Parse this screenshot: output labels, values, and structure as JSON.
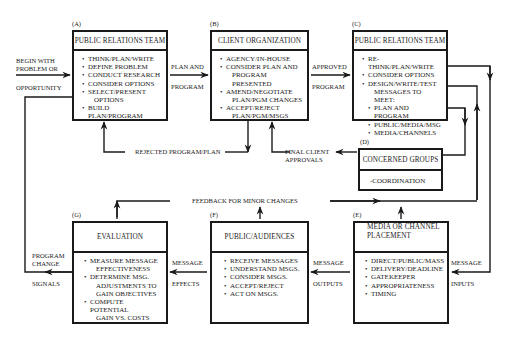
{
  "diagram": {
    "entry": {
      "line1": "BEGIN WITH",
      "line2": "PROBLEM OR",
      "line3": "OPPORTUNITY"
    },
    "boxes": {
      "A": {
        "tag": "(A)",
        "title": "PUBLIC RELATIONS TEAM",
        "items": [
          "THINK/PLAN/WRITE",
          "DEFINE PROBLEM",
          "CONDUCT RESEARCH",
          "CONSIDER OPTIONS",
          "SELECT/PRESENT",
          "BUILD PLAN/PROGRAM"
        ],
        "item_cont": {
          "4": "OPTIONS"
        }
      },
      "B": {
        "tag": "(B)",
        "title": "CLIENT ORGANIZATION",
        "items": [
          "AGENCY/IN-HOUSE",
          "CONSIDER PLAN AND",
          "AMEND/NEGOTIATE",
          "ACCEPT/REJECT"
        ],
        "item_cont": {
          "1": "PROGRAM PRESENTED",
          "2": "PLAN/PGM CHANGES",
          "3": "PLAN/PGM/MSGS"
        }
      },
      "C": {
        "tag": "(C)",
        "title": "PUBLIC RELATIONS TEAM",
        "items": [
          "RE-THINK/PLAN/WRITE",
          "CONSIDER OPTIONS",
          "DESIGN/WRITE/TEST"
        ],
        "item_cont": {
          "2": "MESSAGES TO MEET:"
        },
        "subitems": [
          "PLAN AND PROGRAM",
          "PUBLIC/MEDIA/MSG",
          "MEDIA/CHANNELS"
        ]
      },
      "D": {
        "tag": "(D)",
        "title": "CONCERNED GROUPS",
        "body": "-COORDINATION"
      },
      "E": {
        "tag": "(E)",
        "title_line1": "MEDIA OR CHANNEL",
        "title_line2": "PLACEMENT",
        "items": [
          "DIRECT/PUBLIC/MASS",
          "DELIVERY/DEADLINE",
          "GATEKEEPER",
          "APPROPRIATENESS",
          "TIMING"
        ]
      },
      "F": {
        "tag": "(F)",
        "title": "PUBLIC/AUDIENCES",
        "items": [
          "RECEIVE MESSAGES",
          "UNDERSTAND MSGS.",
          "CONSIDER MSGS.",
          "ACCEPT/REJECT",
          "ACT ON MSGS."
        ]
      },
      "G": {
        "tag": "(G)",
        "title": "EVALUATION",
        "items": [
          "MEASURE MESSAGE",
          "DETERMINE MSG.",
          "COMPUTE POTENTIAL"
        ],
        "item_cont": {
          "0": "EFFECTIVENESS",
          "1": "ADJUSTMENTS TO",
          "1b": "GAIN OBJECTIVES",
          "2": "GAIN VS. COSTS"
        }
      }
    },
    "connectors": {
      "a_to_b": {
        "line1": "PLAN AND",
        "line2": "PROGRAM"
      },
      "b_to_c": {
        "line1": "APPROVED",
        "line2": "PROGRAM"
      },
      "rejected": "REJECTED PROGRAM/PLAN",
      "final_approvals": {
        "line1": "FINAL CLIENT",
        "line2": "APPROVALS"
      },
      "feedback": "FEEDBACK FOR MINOR CHANGES",
      "message_inputs": {
        "line1": "MESSAGE",
        "line2": "INPUTS"
      },
      "message_outputs": {
        "line1": "MESSAGE",
        "line2": "OUTPUTS"
      },
      "message_effects": {
        "line1": "MESSAGE",
        "line2": "EFFECTS"
      },
      "program_change": {
        "line1": "PROGRAM",
        "line2": "CHANGE",
        "line3": "SIGNALS"
      }
    }
  }
}
